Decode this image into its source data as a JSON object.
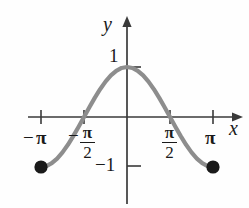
{
  "chart_data": {
    "type": "line",
    "title": "",
    "xlabel": "x",
    "ylabel": "y",
    "function": "y = cos(x)",
    "xlim": [
      -3.6651914291880923,
      4.1887902047863905
    ],
    "ylim": [
      -1.75,
      1.45
    ],
    "grid": false,
    "legend": null,
    "x_tick_labels": [
      "−π",
      "−π/2",
      "π/2",
      "π"
    ],
    "x_tick_values": [
      -3.141592653589793,
      -1.5707963267948966,
      1.5707963267948966,
      3.141592653589793
    ],
    "y_tick_labels": [
      "1",
      "−1"
    ],
    "y_tick_values": [
      1,
      -1
    ],
    "series": [
      {
        "name": "cos(x)",
        "color": "#8d8d8d",
        "x": [
          -3.141592653589793,
          -2.945243112740431,
          -2.748893571891069,
          -2.552544031041707,
          -2.356194490192345,
          -2.159844949342983,
          -1.9634954084936207,
          -1.7671458676442586,
          -1.5707963267948966,
          -1.3744467859455345,
          -1.1780972450961724,
          -0.9817477042468103,
          -0.7853981633974483,
          -0.5890486225480862,
          -0.39269908169872414,
          -0.19634954084936207,
          0,
          0.19634954084936207,
          0.39269908169872414,
          0.5890486225480862,
          0.7853981633974483,
          0.9817477042468103,
          1.1780972450961724,
          1.3744467859455345,
          1.5707963267948966,
          1.7671458676442586,
          1.9634954084936207,
          2.159844949342983,
          2.356194490192345,
          2.552544031041707,
          2.748893571891069,
          2.945243112740431,
          3.141592653589793
        ],
        "y": [
          -1,
          -0.98078528,
          -0.92387953,
          -0.83146961,
          -0.70710678,
          -0.55557023,
          -0.38268343,
          -0.19509032,
          0,
          0.19509032,
          0.38268343,
          0.55557023,
          0.70710678,
          0.83146961,
          0.92387953,
          0.98078528,
          1,
          0.98078528,
          0.92387953,
          0.83146961,
          0.70710678,
          0.55557023,
          0.38268343,
          0.19509032,
          0,
          -0.19509032,
          -0.38268343,
          -0.55557023,
          -0.70710678,
          -0.83146961,
          -0.92387953,
          -0.98078528,
          -1
        ]
      }
    ],
    "endpoints": [
      {
        "name": "left-endpoint",
        "x": -3.141592653589793,
        "y": -1,
        "marker": "filled-circle",
        "color": "#1a1a1a"
      },
      {
        "name": "right-endpoint",
        "x": 3.141592653589793,
        "y": -1,
        "marker": "filled-circle",
        "color": "#1a1a1a"
      }
    ],
    "colors": {
      "curve": "#8d8d8d",
      "axis": "#3a3a3a",
      "text": "#1a1a1a",
      "marker": "#1a1a1a",
      "background": "#fefefe"
    }
  },
  "labels": {
    "y_axis_label": "y",
    "x_axis_label": "x",
    "tick_one": "1",
    "tick_neg_one": "−1",
    "tick_neg_pi": "π",
    "tick_pi": "π",
    "minus": "−",
    "frac_numerator": "π",
    "frac_denominator": "2"
  }
}
